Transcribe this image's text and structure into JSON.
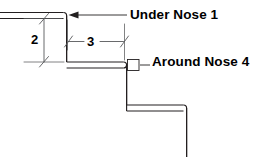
{
  "figure": {
    "background_color": "#ffffff",
    "line_color": "#231f20",
    "dim_line_color": "#58595b",
    "text_color": "#000000"
  },
  "callouts": [
    {
      "id": "under-nose",
      "label": "Under Nose 1",
      "terminator": "arrow",
      "points_to": "top-nosing"
    },
    {
      "id": "around-nose",
      "label": "Around Nose 4",
      "terminator": "square",
      "points_to": "middle-nosing"
    }
  ],
  "dimensions": [
    {
      "id": "vertical-riser",
      "value": "2",
      "orientation": "vertical",
      "terminator": "slash"
    },
    {
      "id": "horizontal-tread",
      "value": "3",
      "orientation": "horizontal",
      "terminator": "slash"
    }
  ],
  "geometry": {
    "description": "Two-step stair section profile drawn as double offset lines with rounded nosings",
    "steps": 2
  }
}
